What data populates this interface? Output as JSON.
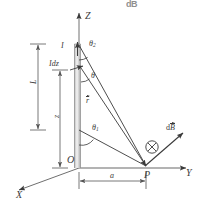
{
  "figure": {
    "title_fragment": "dB",
    "colors": {
      "stroke": "#3a3a3a",
      "axis": "#808080",
      "wire_light": "#f2f2f2",
      "wire_mid": "#c8c8c8",
      "wire_dark": "#9a9a9a",
      "background": "#ffffff",
      "dimension": "#555555"
    }
  },
  "axes": [
    {
      "name": "z-axis",
      "label": "Z"
    },
    {
      "name": "y-axis",
      "label": "Y"
    },
    {
      "name": "x-axis",
      "label": "X"
    }
  ],
  "points": [
    {
      "name": "origin",
      "label": "O"
    },
    {
      "name": "field-point",
      "label": "P"
    }
  ],
  "labels": {
    "current": "I",
    "current_element": {
      "prefix": "I",
      "suffix": "dz"
    },
    "length": "L",
    "height_variable": "z",
    "distance": "a",
    "theta_top": {
      "base": "θ",
      "sub": "2"
    },
    "theta_bottom": {
      "base": "θ",
      "sub": "1"
    },
    "theta_mid": "θ",
    "r_vector": "r",
    "dB_vector": {
      "prefix": "d",
      "base": "B"
    }
  },
  "symbols": [
    {
      "name": "into-page-symbol",
      "glyph": "⊗",
      "meaning": "vector directed into the page"
    }
  ],
  "dimensions": [
    {
      "name": "length-dimension",
      "label": "L",
      "orientation": "vertical"
    },
    {
      "name": "height-dimension",
      "label": "z",
      "orientation": "vertical"
    },
    {
      "name": "distance-dimension",
      "label": "a",
      "orientation": "horizontal"
    }
  ]
}
